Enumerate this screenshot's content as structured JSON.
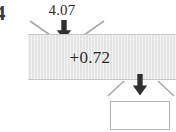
{
  "diagram": {
    "edge_marker": "4",
    "input": {
      "label": "4.07",
      "arrow_icon": "arrow-down-icon",
      "funnel_icon": "funnel-notch-icon"
    },
    "process_block": {
      "value": "+0.72",
      "fill_color": "#e4e4e4",
      "border_color": "#c9c9c9"
    },
    "output": {
      "label": "",
      "arrow_icon": "arrow-down-icon",
      "funnel_icon": "funnel-notch-icon",
      "box_fill": "#ffffff",
      "box_border": "#b4b4b4"
    },
    "colors": {
      "text": "#2b2b2b",
      "arrow": "#303030",
      "funnel_line": "#a8a8a8",
      "background": "#ffffff"
    }
  }
}
